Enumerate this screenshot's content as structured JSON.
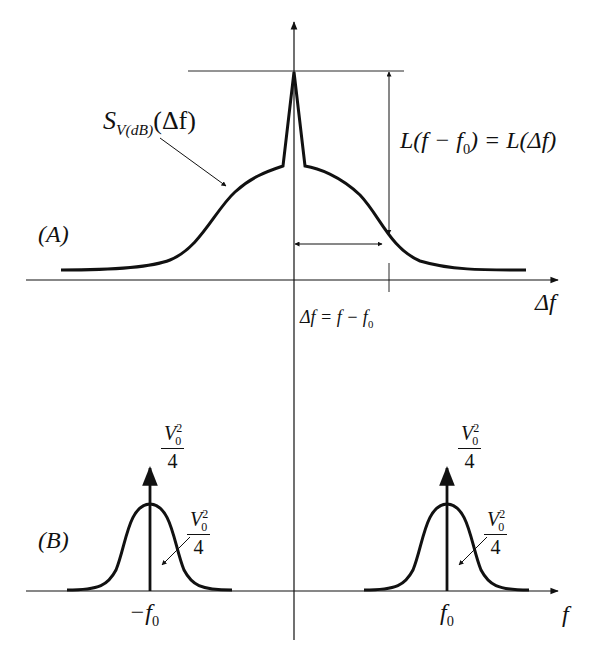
{
  "diagram": {
    "panel_a": {
      "label": "(A)",
      "curve_label_main": "S",
      "curve_label_sub": "V(dB)",
      "curve_label_arg": "(Δf)",
      "ratio_label": "L(f − f",
      "ratio_label_sub": "0",
      "ratio_label_end": ") = L(Δf)",
      "x_axis_label": "Δf",
      "below_axis_label": "Δf = f − f",
      "below_axis_label_sub": "0"
    },
    "panel_b": {
      "label": "(B)",
      "left_center": "−f",
      "left_center_sub": "0",
      "right_center": "f",
      "right_center_sub": "0",
      "x_axis_label": "f",
      "impulse_numerator": "V",
      "impulse_sup": "2",
      "impulse_sub": "0",
      "impulse_denominator": "4"
    },
    "stroke_color": "#111111",
    "background": "#ffffff"
  }
}
